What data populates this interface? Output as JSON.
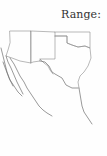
{
  "page": {
    "faint_header": "",
    "range_label": "Range:",
    "right_column_fragments": [
      {
        "text": "c",
        "row": 0
      },
      {
        "text": "A",
        "row": 1
      },
      {
        "text": "T",
        "row": 2
      },
      {
        "text": "T",
        "row": 5
      },
      {
        "text": "c",
        "row": 6
      },
      {
        "text": "f",
        "row": 7
      },
      {
        "text": "i",
        "row": 8
      },
      {
        "text": "c",
        "row": 9
      },
      {
        "text": "t",
        "row": 10
      },
      {
        "text": "l",
        "row": 11
      },
      {
        "text": "r",
        "row": 12
      }
    ]
  },
  "map": {
    "title": "Range map",
    "regions": [
      "Arizona",
      "New Mexico",
      "Oklahoma",
      "Texas",
      "Baja California",
      "Sonora",
      "Chihuahua",
      "Coahuila",
      "Nuevo León",
      "Tamaulipas"
    ],
    "colors": {
      "border": "#8a8a8a",
      "coast": "#6f6f6f"
    }
  }
}
